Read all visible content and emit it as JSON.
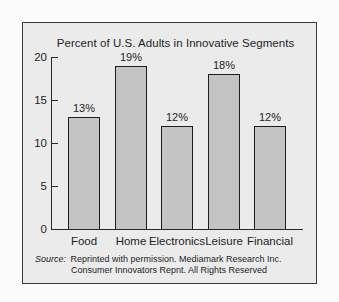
{
  "chart_data": {
    "type": "bar",
    "title": "Percent of U.S. Adults in Innovative Segments",
    "categories": [
      "Food",
      "Home",
      "Electronics",
      "Leisure",
      "Financial"
    ],
    "values": [
      13,
      19,
      12,
      18,
      12
    ],
    "value_labels": [
      "13%",
      "19%",
      "12%",
      "18%",
      "12%"
    ],
    "xlabel": "",
    "ylabel": "",
    "ylim": [
      0,
      20
    ],
    "yticks": [
      0,
      5,
      10,
      15,
      20
    ],
    "ytick_labels": [
      "0",
      "5",
      "10",
      "15",
      "20"
    ],
    "grid": false,
    "legend": null,
    "colors": {
      "bar_fill": "#c4c4c4",
      "bar_edge": "#1e1e1e",
      "panel_bg": "#ebebeb",
      "page_bg": "#fbfbfb"
    }
  },
  "source": {
    "label": "Source:",
    "line1": "Reprinted with permission. Mediamark Research Inc.",
    "line2": "Consumer Innovators Repnt. All Rights Reserved"
  }
}
